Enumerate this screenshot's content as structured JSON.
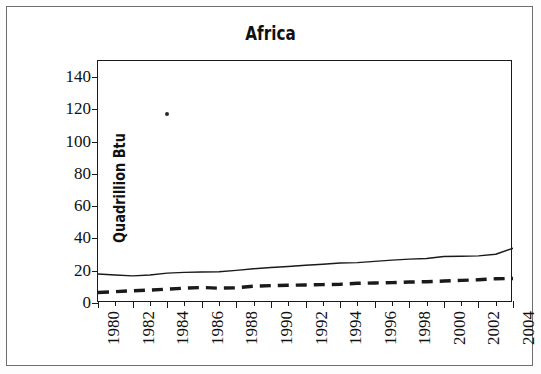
{
  "figure": {
    "title": "Africa",
    "background": "#ffffff",
    "border_color": "#6e6e6e",
    "axis_color": "#1a1a1a"
  },
  "chart_data": {
    "type": "line",
    "title": "Africa",
    "xlabel": "",
    "ylabel": "Quadrillion Btu",
    "xlim": [
      1980,
      2004
    ],
    "ylim": [
      0,
      150
    ],
    "yticks": [
      0,
      20,
      40,
      60,
      80,
      100,
      120,
      140
    ],
    "xticks": [
      1980,
      1982,
      1984,
      1986,
      1988,
      1990,
      1992,
      1994,
      1996,
      1998,
      2000,
      2002,
      2004
    ],
    "xtick_labels": [
      "1980",
      "1982",
      "1984",
      "1986",
      "1988",
      "1990",
      "1992",
      "1994",
      "1996",
      "1998",
      "2000",
      "2002",
      "2004"
    ],
    "ytick_labels": [
      "0",
      "20",
      "40",
      "60",
      "80",
      "100",
      "120",
      "140"
    ],
    "grid": false,
    "legend": "none",
    "x": [
      1980,
      1981,
      1982,
      1983,
      1984,
      1985,
      1986,
      1987,
      1988,
      1989,
      1990,
      1991,
      1992,
      1993,
      1994,
      1995,
      1996,
      1997,
      1998,
      1999,
      2000,
      2001,
      2002,
      2003,
      2004
    ],
    "series": [
      {
        "name": "production",
        "style": "solid",
        "color": "#1a1a1a",
        "width": 1.4,
        "values": [
          18.0,
          17.4,
          16.8,
          17.4,
          18.5,
          19.0,
          19.2,
          19.4,
          20.2,
          21.2,
          22.0,
          22.6,
          23.4,
          24.0,
          24.8,
          25.0,
          25.8,
          26.6,
          27.2,
          27.6,
          28.8,
          29.0,
          29.2,
          30.2,
          34.0
        ]
      },
      {
        "name": "consumption",
        "style": "dashed",
        "color": "#1a1a1a",
        "width": 3.4,
        "values": [
          6.5,
          7.0,
          7.6,
          8.0,
          8.6,
          9.2,
          9.6,
          9.2,
          9.4,
          10.4,
          10.8,
          11.0,
          11.2,
          11.4,
          11.6,
          12.2,
          12.4,
          12.6,
          13.0,
          13.2,
          13.6,
          14.0,
          14.4,
          15.0,
          15.2
        ]
      }
    ],
    "artifacts": [
      {
        "name": "stray-speck",
        "x": 1984,
        "y": 117
      }
    ]
  }
}
